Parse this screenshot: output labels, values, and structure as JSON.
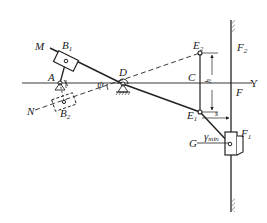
{
  "diagram": {
    "type": "mechanism-linkage",
    "points": {
      "A": "A",
      "B1": "B",
      "B1_sub": "1",
      "B2": "B",
      "B2_sub": "2",
      "C": "C",
      "D": "D",
      "E1": "E",
      "E1_sub": "1",
      "E2": "E",
      "E2_sub": "2",
      "F": "F",
      "F1": "F",
      "F1_sub": "1",
      "F2": "F",
      "F2_sub": "2",
      "G": "G",
      "M": "M",
      "N": "N",
      "Y": "Y"
    },
    "annotations": {
      "angle_psi": "ψ",
      "height_h": "h",
      "distance_s": "s",
      "gamma": "γ",
      "gamma_sub": "min"
    }
  }
}
